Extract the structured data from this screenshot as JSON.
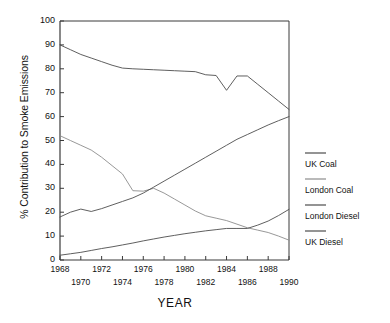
{
  "chart_data": {
    "type": "line",
    "title": "",
    "xlabel": "YEAR",
    "ylabel": "% Contribution to Smoke Emissions",
    "xlim": [
      1968,
      1990
    ],
    "ylim": [
      0,
      100
    ],
    "grid": false,
    "legend_position": "right",
    "x": [
      1968,
      1969,
      1970,
      1971,
      1972,
      1973,
      1974,
      1975,
      1976,
      1977,
      1978,
      1979,
      1980,
      1981,
      1982,
      1983,
      1984,
      1985,
      1986,
      1987,
      1988,
      1989,
      1990
    ],
    "xticks": [
      1968,
      1970,
      1972,
      1974,
      1976,
      1978,
      1980,
      1982,
      1984,
      1986,
      1988,
      1990
    ],
    "xticklabels_top": [
      "1968",
      "1972",
      "1976",
      "1980",
      "1984",
      "1988"
    ],
    "xticklabels_bottom": [
      "1970",
      "1974",
      "1978",
      "1982",
      "1986",
      "1990"
    ],
    "yticks": [
      0,
      10,
      20,
      30,
      40,
      50,
      60,
      70,
      80,
      90,
      100
    ],
    "yticklabels": [
      "0",
      "10",
      "20",
      "30",
      "40",
      "50",
      "60",
      "70",
      "80",
      "90",
      "100"
    ],
    "series": [
      {
        "name": "UK Coal",
        "color": "#4d4d4d",
        "values": [
          90.0,
          88.0,
          86.0,
          84.5,
          83.0,
          81.5,
          80.3,
          80.0,
          79.8,
          79.6,
          79.4,
          79.2,
          79.0,
          78.8,
          77.5,
          77.2,
          71.0,
          77.0,
          77.0,
          73.5,
          70.0,
          66.5,
          63.0
        ]
      },
      {
        "name": "London Coal",
        "color": "#8c8c8c",
        "values": [
          52.0,
          50.0,
          48.0,
          46.0,
          43.0,
          39.5,
          36.0,
          29.0,
          28.8,
          30.0,
          28.0,
          25.5,
          23.0,
          20.5,
          18.5,
          17.5,
          16.5,
          15.0,
          13.5,
          12.5,
          11.5,
          10.0,
          8.3
        ]
      },
      {
        "name": "London Diesel",
        "color": "#4d4d4d",
        "values": [
          18.0,
          20.0,
          21.3,
          20.3,
          21.5,
          23.0,
          24.5,
          26.0,
          28.0,
          30.5,
          33.0,
          35.5,
          38.0,
          40.5,
          43.0,
          45.5,
          48.0,
          50.5,
          52.5,
          54.5,
          56.5,
          58.3,
          60.0
        ]
      },
      {
        "name": "UK Diesel",
        "color": "#4d4d4d",
        "values": [
          2.0,
          2.6,
          3.2,
          4.0,
          4.8,
          5.5,
          6.3,
          7.1,
          8.0,
          8.8,
          9.6,
          10.3,
          11.0,
          11.6,
          12.2,
          12.7,
          13.2,
          13.2,
          13.2,
          14.6,
          16.3,
          18.6,
          21.2
        ]
      }
    ]
  },
  "legend": {
    "items": [
      {
        "label": "UK Coal"
      },
      {
        "label": "London Coal"
      },
      {
        "label": "London Diesel"
      },
      {
        "label": "UK Diesel"
      }
    ]
  }
}
